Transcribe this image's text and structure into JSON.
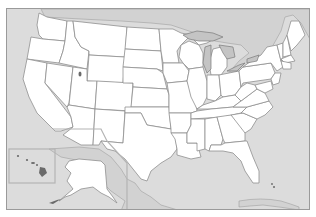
{
  "map": {
    "title": "",
    "type": "blank outline map",
    "region": "United States (contiguous 48 states with Alaska and Hawaii insets)",
    "colors": {
      "water": "#dcdcdc",
      "states": "#ffffff",
      "borders": "#8f8f8f",
      "neighbor_land": "#d2d2d2",
      "lakes": "#c4c4c4",
      "frame": "#9a9a9a"
    },
    "insets": [
      {
        "name": "hawaii"
      },
      {
        "name": "alaska"
      }
    ],
    "labels": []
  }
}
